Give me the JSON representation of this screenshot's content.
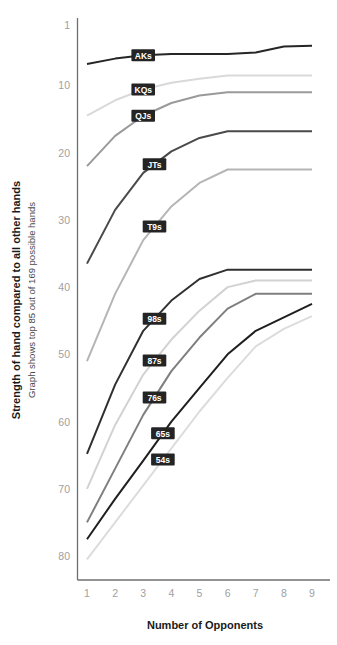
{
  "chart_data": {
    "type": "line",
    "title": "",
    "xlabel": "Number of Opponents",
    "ylabel": "Strength of hand compared to all other hands",
    "ylabel_sub": "Graph shows top 85 out of 169 possible hands",
    "x": [
      1,
      2,
      3,
      4,
      5,
      6,
      7,
      8,
      9
    ],
    "xticks": [
      "1",
      "2",
      "3",
      "4",
      "5",
      "6",
      "7",
      "8",
      "9"
    ],
    "yticks": [
      "1",
      "10",
      "20",
      "30",
      "40",
      "50",
      "60",
      "70",
      "80"
    ],
    "ytick_values": [
      1,
      10,
      20,
      30,
      40,
      50,
      60,
      70,
      80
    ],
    "ylim": [
      1,
      82
    ],
    "y_inverted": true,
    "grid": false,
    "legend": "inline-labels",
    "series": [
      {
        "name": "AKs",
        "color": "#262626",
        "width": 2.0,
        "label_x": 3.0,
        "values": [
          6.8,
          6.0,
          5.5,
          5.3,
          5.3,
          5.3,
          5.1,
          4.2,
          4.1
        ]
      },
      {
        "name": "KQs",
        "color": "#d9d9d9",
        "width": 2.0,
        "label_x": 3.0,
        "values": [
          14.5,
          12.2,
          10.6,
          9.6,
          9.0,
          8.5,
          8.5,
          8.5,
          8.5
        ]
      },
      {
        "name": "QJs",
        "color": "#9a9a9a",
        "width": 2.0,
        "label_x": 3.0,
        "values": [
          22.0,
          17.5,
          14.5,
          12.6,
          11.5,
          11.0,
          11.0,
          11.0,
          11.0
        ]
      },
      {
        "name": "JTs",
        "color": "#4a4a4a",
        "width": 2.0,
        "label_x": 3.4,
        "values": [
          36.5,
          28.5,
          23.0,
          19.8,
          17.8,
          16.8,
          16.8,
          16.8,
          16.8
        ]
      },
      {
        "name": "T9s",
        "color": "#b5b5b5",
        "width": 2.0,
        "label_x": 3.4,
        "values": [
          51.0,
          41.0,
          33.0,
          28.0,
          24.5,
          22.5,
          22.5,
          22.5,
          22.5
        ]
      },
      {
        "name": "98s",
        "color": "#303030",
        "width": 2.0,
        "label_x": 3.4,
        "values": [
          64.8,
          54.5,
          46.5,
          42.0,
          38.8,
          37.4,
          37.4,
          37.4,
          37.4
        ]
      },
      {
        "name": "87s",
        "color": "#d2d2d2",
        "width": 2.0,
        "label_x": 3.4,
        "values": [
          70.0,
          60.5,
          53.0,
          47.8,
          43.5,
          40.0,
          39.0,
          39.0,
          39.0
        ]
      },
      {
        "name": "76s",
        "color": "#7f7f7f",
        "width": 2.0,
        "label_x": 3.4,
        "values": [
          75.0,
          67.0,
          59.0,
          52.5,
          47.5,
          43.2,
          41.0,
          41.0,
          41.0
        ]
      },
      {
        "name": "65s",
        "color": "#1f1f1f",
        "width": 2.0,
        "label_x": 3.7,
        "values": [
          77.5,
          71.5,
          65.8,
          60.0,
          55.0,
          50.0,
          46.5,
          44.5,
          42.5
        ]
      },
      {
        "name": "54s",
        "color": "#dcdcdc",
        "width": 2.0,
        "label_x": 3.7,
        "values": [
          80.5,
          75.0,
          69.5,
          64.0,
          58.5,
          53.5,
          48.8,
          46.2,
          44.3
        ]
      }
    ]
  }
}
